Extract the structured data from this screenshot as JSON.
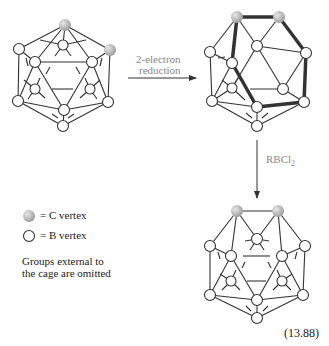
{
  "reaction": {
    "step1_label_line1": "2-electron",
    "step1_label_line2": "reduction",
    "step2_label": "RBCl",
    "step2_subscript": "2",
    "equation_number": "(13.88)"
  },
  "legend": {
    "c_vertex": "= C vertex",
    "b_vertex": "= B vertex",
    "note_line1": "Groups external to",
    "note_line2": "the cage are omitted"
  },
  "colors": {
    "c_vertex_fill": "#b0b0b0",
    "b_vertex_fill": "#ffffff",
    "edge": "#333333",
    "arrow_label": "#888888"
  },
  "structures": [
    {
      "name": "closo-C2B10 icosahedron",
      "position": "top-left"
    },
    {
      "name": "nido-C2B10 dianion",
      "position": "top-right"
    },
    {
      "name": "closo-C2B11 docosahedron",
      "position": "bottom-right"
    }
  ]
}
